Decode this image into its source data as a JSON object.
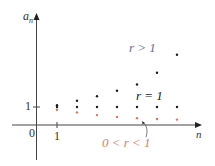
{
  "chart_data": {
    "type": "scatter",
    "title": "",
    "xlabel": "n",
    "ylabel": "a_n",
    "x_ticks": [
      "0",
      "1"
    ],
    "y_ticks": [
      "1"
    ],
    "grid": false,
    "legend": "inline annotations",
    "x": [
      1,
      2,
      3,
      4,
      5,
      6,
      7
    ],
    "series": [
      {
        "name": "r > 1",
        "color": "#1a1a1a",
        "label_color": "#5a6fa0",
        "values": [
          1.1,
          1.35,
          1.6,
          1.9,
          2.25,
          2.9,
          3.9
        ]
      },
      {
        "name": "r = 1",
        "color": "#1a1a1a",
        "label_color": "#1a1a1a",
        "values": [
          1,
          1,
          1,
          1,
          1,
          1,
          1
        ]
      },
      {
        "name": "0 < r < 1",
        "color": "#e0705a",
        "label_color": "#e07b6a",
        "values": [
          0.85,
          0.7,
          0.55,
          0.45,
          0.38,
          0.33,
          0.3
        ]
      }
    ]
  },
  "labels": {
    "y_axis": "a",
    "y_axis_sub": "n",
    "x_axis": "n",
    "origin": "0",
    "x_tick_1": "1",
    "y_tick_1": "1",
    "r_gt_1": "r > 1",
    "r_eq_1": "r = 1",
    "r_lt_1": "0 < r < 1"
  },
  "colors": {
    "axis": "#444444",
    "point_dark": "#1a1a1a",
    "point_red": "#e0705a",
    "label_blue": "#5a6fa0",
    "label_red": "#e07b6a"
  }
}
